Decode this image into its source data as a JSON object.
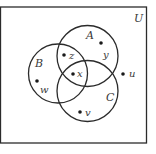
{
  "diagram": {
    "type": "venn",
    "universe": {
      "label": "U",
      "label_pos": [
        134,
        22
      ]
    },
    "sets": [
      {
        "id": "A",
        "label": "A",
        "cx": 87.5,
        "cy": 56,
        "r": 30.5,
        "label_pos": [
          86,
          39
        ]
      },
      {
        "id": "B",
        "label": "B",
        "cx": 58,
        "cy": 73.5,
        "r": 29.5,
        "label_pos": [
          35,
          67
        ]
      },
      {
        "id": "C",
        "label": "C",
        "cx": 87.5,
        "cy": 91,
        "r": 30.5,
        "label_pos": [
          106,
          101
        ]
      }
    ],
    "points": [
      {
        "name": "z",
        "label": "z",
        "dot": [
          64,
          55
        ],
        "label_pos": [
          69,
          59
        ],
        "membership": [
          "A",
          "B"
        ]
      },
      {
        "name": "x",
        "label": "x",
        "dot": [
          73,
          74
        ],
        "label_pos": [
          77,
          77
        ],
        "membership": [
          "A",
          "B",
          "C"
        ]
      },
      {
        "name": "y",
        "label": "y",
        "dot": [
          101,
          43
        ],
        "label_pos": [
          103,
          58
        ],
        "membership": [
          "A"
        ]
      },
      {
        "name": "w",
        "label": "w",
        "dot": [
          37,
          81
        ],
        "label_pos": [
          40,
          93
        ],
        "membership": [
          "B"
        ]
      },
      {
        "name": "v",
        "label": "v",
        "dot": [
          80,
          112
        ],
        "label_pos": [
          85,
          116
        ],
        "membership": [
          "C"
        ]
      },
      {
        "name": "u",
        "label": "u",
        "dot": [
          123,
          74
        ],
        "label_pos": [
          129,
          77
        ],
        "membership": []
      }
    ],
    "style": {
      "stroke": "#2b2b2b",
      "dot": "#1a1a1a",
      "background": "#ffffff"
    }
  }
}
